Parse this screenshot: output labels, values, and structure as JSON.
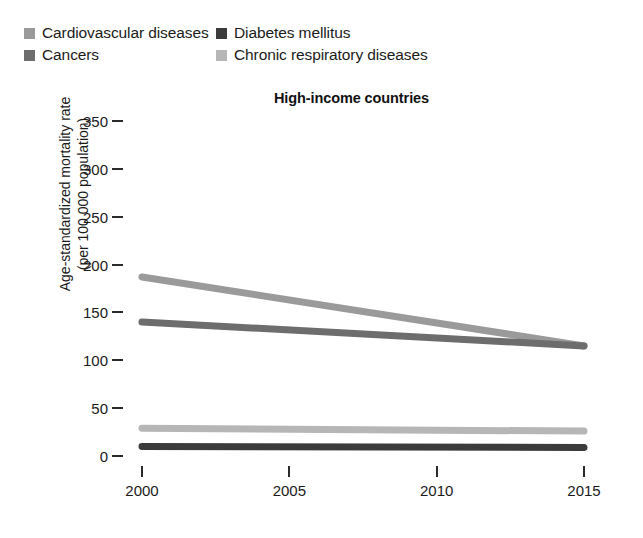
{
  "chart_data": {
    "type": "line",
    "title": "High-income countries",
    "xlabel": "",
    "ylabel": "Age-standardized mortality rate (per 100 000 population)",
    "ylabel_line1": "Age-standardized mortality rate",
    "ylabel_line2": "(per 100 000 population)",
    "x": [
      2000,
      2015
    ],
    "xticks": [
      2000,
      2005,
      2010,
      2015
    ],
    "xtick_labels": [
      "2000",
      "2005",
      "2010",
      "2015"
    ],
    "xlim": [
      2000,
      2015
    ],
    "yticks": [
      0,
      50,
      100,
      150,
      200,
      250,
      300,
      350
    ],
    "ytick_labels": [
      "0",
      "50",
      "100",
      "150",
      "200",
      "250",
      "300",
      "350"
    ],
    "ylim": [
      0,
      350
    ],
    "grid": false,
    "legend_position": "top-left",
    "series": [
      {
        "name": "Cardiovascular diseases",
        "color": "#9a9a9a",
        "values": [
          187,
          115
        ]
      },
      {
        "name": "Cancers",
        "color": "#6d6d6d",
        "values": [
          140,
          115
        ]
      },
      {
        "name": "Chronic respiratory diseases",
        "color": "#b6b6b6",
        "values": [
          29,
          26
        ]
      },
      {
        "name": "Diabetes mellitus",
        "color": "#3b3b3b",
        "values": [
          10,
          9
        ]
      }
    ],
    "annotations": []
  },
  "legend": {
    "items": [
      {
        "label": "Cardiovascular diseases",
        "color": "#9a9a9a"
      },
      {
        "label": "Diabetes mellitus",
        "color": "#3b3b3b"
      },
      {
        "label": "Cancers",
        "color": "#6d6d6d"
      },
      {
        "label": "Chronic respiratory diseases",
        "color": "#b6b6b6"
      }
    ]
  }
}
